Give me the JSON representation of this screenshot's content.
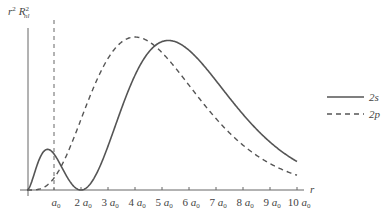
{
  "chart_data": {
    "type": "line",
    "title": "",
    "xlabel": "r",
    "ylabel": "r² R²nl",
    "ylabel_parts": {
      "base": "r",
      "sup": "2",
      "base2": "R",
      "sup2": "2",
      "sub2": "nl"
    },
    "x_unit": "a0",
    "xlim": [
      0,
      10
    ],
    "ylim": [
      0,
      0.2
    ],
    "grid": false,
    "legend_position": "right",
    "x_ticks": [
      1,
      2,
      3,
      4,
      5,
      6,
      7,
      8,
      9,
      10
    ],
    "x_tick_labels": [
      "a0",
      "2 a0",
      "3 a0",
      "4 a0",
      "5 a0",
      "6 a0",
      "7 a0",
      "8 a0",
      "9 a0",
      "10 a0"
    ],
    "x_tick_labels_display": [
      {
        "coef": "",
        "unit": "a",
        "sub": "0"
      },
      {
        "coef": "2 ",
        "unit": "a",
        "sub": "0"
      },
      {
        "coef": "3 ",
        "unit": "a",
        "sub": "0"
      },
      {
        "coef": "4 ",
        "unit": "a",
        "sub": "0"
      },
      {
        "coef": "5 ",
        "unit": "a",
        "sub": "0"
      },
      {
        "coef": "6 ",
        "unit": "a",
        "sub": "0"
      },
      {
        "coef": "7 ",
        "unit": "a",
        "sub": "0"
      },
      {
        "coef": "8 ",
        "unit": "a",
        "sub": "0"
      },
      {
        "coef": "9 ",
        "unit": "a",
        "sub": "0"
      },
      {
        "coef": "10 ",
        "unit": "a",
        "sub": "0"
      }
    ],
    "reference_line": {
      "x": 1,
      "style": "dashed",
      "label": "a0"
    },
    "x": [
      0,
      0.25,
      0.5,
      0.764,
      1,
      1.25,
      1.5,
      1.75,
      2,
      2.5,
      3,
      3.5,
      4,
      4.5,
      5,
      5.236,
      5.5,
      6,
      6.5,
      7,
      7.5,
      8,
      8.5,
      9,
      9.5,
      10
    ],
    "series": [
      {
        "name": "2s",
        "style": "solid",
        "formula": "r^2 (2-r)^2 e^(-r) / 8",
        "values": [
          0,
          0.027,
          0.0427,
          0.0519,
          0.046,
          0.0252,
          0.0105,
          0.0011,
          0,
          0.0064,
          0.0187,
          0.0496,
          0.0733,
          0.1004,
          0.1264,
          0.1909,
          0.1886,
          0.1785,
          0.1624,
          0.1418,
          0.1204,
          0.0997,
          0.0809,
          0.0643,
          0.0503,
          0.0363
        ]
      },
      {
        "name": "2p",
        "style": "dashed",
        "formula": "r^4 e^(-r) / 24",
        "values": [
          0,
          0.0001,
          0.0016,
          0.0066,
          0.0153,
          0.0291,
          0.0472,
          0.0681,
          0.0902,
          0.1335,
          0.168,
          0.1894,
          0.1954,
          0.1874,
          0.1755,
          0.1684,
          0.1597,
          0.1338,
          0.1104,
          0.0912,
          0.073,
          0.0573,
          0.0443,
          0.0338,
          0.0254,
          0.0189
        ]
      }
    ]
  },
  "legend": {
    "items": [
      {
        "label": "2s",
        "style": "solid"
      },
      {
        "label": "2p",
        "style": "dashed"
      }
    ]
  },
  "axis": {
    "x_label": "r"
  }
}
